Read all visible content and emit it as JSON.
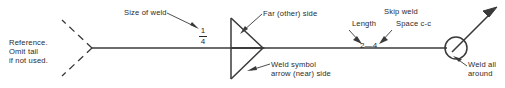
{
  "diagram": {
    "colors": {
      "line": "#3a3a3a",
      "text": "#2b2b2b",
      "background": "#ffffff"
    },
    "labels": {
      "reference": "Reference.\nOmit tail\nif not used.",
      "size_of_weld": "Size of weld",
      "far_other_side": "Far (other) side",
      "skip_weld": "Skip weld",
      "length": "Length",
      "space_cc": "Space c-c",
      "weld_symbol_arrow_near_side": "Weld symbol\narrow (near) side",
      "weld_all_around": "Weld all\naround"
    },
    "values": {
      "weld_size_numerator": "1",
      "weld_size_denominator": "4",
      "length_space_pitch": "2—4"
    },
    "symbols": {
      "tail": "dashed-forked-tail",
      "weld_symbol": "double-v-fillet-triangle",
      "weld_all_around_symbol": "circle-at-kink",
      "leader": "arrow-leader-line"
    }
  }
}
